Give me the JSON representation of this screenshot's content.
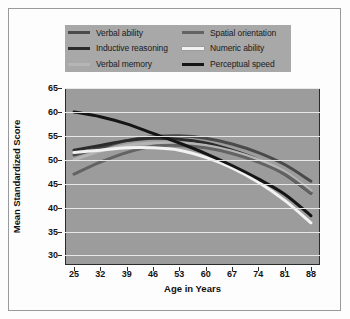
{
  "chart_data": {
    "type": "line",
    "title": "",
    "xlabel": "Age in Years",
    "ylabel": "Mean Standardized Score",
    "xlim": [
      25,
      88
    ],
    "ylim": [
      28,
      65
    ],
    "grid": true,
    "legend_position": "top",
    "x": [
      25,
      32,
      39,
      46,
      53,
      60,
      67,
      74,
      81,
      88
    ],
    "xticks": [
      "25",
      "32",
      "39",
      "46",
      "53",
      "60",
      "67",
      "74",
      "81",
      "88"
    ],
    "yticks": [
      "65",
      "60",
      "55",
      "50",
      "45",
      "40",
      "35",
      "30"
    ],
    "ytick_values": [
      65,
      60,
      55,
      50,
      45,
      40,
      35,
      30
    ],
    "series": [
      {
        "name": "Verbal ability",
        "color": "#4a4a4a",
        "values": [
          51.0,
          52.5,
          54.0,
          54.8,
          55.0,
          54.5,
          53.3,
          51.5,
          49.0,
          45.5
        ]
      },
      {
        "name": "Inductive reasoning",
        "color": "#2b2b2b",
        "values": [
          52.0,
          53.0,
          54.0,
          54.5,
          54.3,
          53.5,
          52.0,
          50.0,
          47.0,
          43.0
        ]
      },
      {
        "name": "Verbal memory",
        "color": "#b5b5b5",
        "values": [
          50.0,
          51.8,
          53.0,
          53.5,
          53.5,
          53.0,
          51.8,
          50.0,
          47.5,
          43.5
        ]
      },
      {
        "name": "Spatial orientation",
        "color": "#636363",
        "values": [
          47.0,
          49.5,
          51.5,
          52.8,
          53.0,
          52.5,
          51.3,
          49.5,
          47.0,
          43.0
        ]
      },
      {
        "name": "Numeric ability",
        "color": "#f2f2f2",
        "values": [
          51.5,
          52.0,
          52.5,
          52.5,
          52.0,
          50.5,
          48.3,
          45.3,
          41.5,
          36.8
        ]
      },
      {
        "name": "Perceptual speed",
        "color": "#151515",
        "values": [
          60.0,
          59.0,
          57.5,
          55.5,
          53.5,
          51.3,
          48.8,
          46.0,
          42.8,
          38.3
        ]
      }
    ]
  },
  "legend": {
    "items": [
      {
        "label": "Verbal ability",
        "color": "#4a4a4a"
      },
      {
        "label": "Spatial orientation",
        "color": "#636363"
      },
      {
        "label": "Inductive reasoning",
        "color": "#2b2b2b"
      },
      {
        "label": "Numeric ability",
        "color": "#f2f2f2"
      },
      {
        "label": "Verbal memory",
        "color": "#b5b5b5"
      },
      {
        "label": "Perceptual speed",
        "color": "#151515"
      }
    ]
  },
  "axes": {
    "y_title": "Mean Standardized Score",
    "x_title": "Age in Years"
  }
}
